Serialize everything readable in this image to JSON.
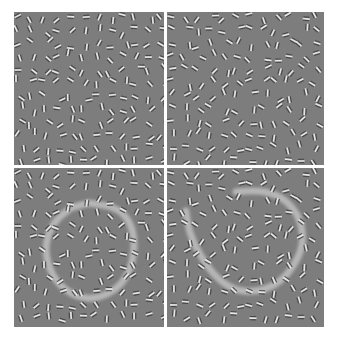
{
  "figure": {
    "background_color": "#ffffff",
    "field_color": "#7d7d7d",
    "element_light": "#e6e6e6",
    "element_dark": "#3a3a3a",
    "contour_color": "#c8c8c8",
    "panels": [
      {
        "id": "top-left",
        "label": "Gabor field (no contour highlight)",
        "seed": 11,
        "highlight": null
      },
      {
        "id": "top-right",
        "label": "Gabor field (no contour highlight)",
        "seed": 23,
        "highlight": null
      },
      {
        "id": "bottom-left",
        "label": "Gabor field with closed contour highlighted",
        "seed": 11,
        "highlight": {
          "closed": true,
          "path": [
            [
              0.5,
              0.22
            ],
            [
              0.7,
              0.25
            ],
            [
              0.8,
              0.38
            ],
            [
              0.8,
              0.58
            ],
            [
              0.72,
              0.74
            ],
            [
              0.55,
              0.83
            ],
            [
              0.38,
              0.8
            ],
            [
              0.25,
              0.68
            ],
            [
              0.2,
              0.5
            ],
            [
              0.26,
              0.34
            ],
            [
              0.38,
              0.25
            ]
          ]
        }
      },
      {
        "id": "bottom-right",
        "label": "Gabor field with open contour highlighted",
        "seed": 23,
        "highlight": {
          "closed": false,
          "path": [
            [
              0.44,
              0.15
            ],
            [
              0.62,
              0.14
            ],
            [
              0.76,
              0.2
            ],
            [
              0.85,
              0.32
            ],
            [
              0.87,
              0.47
            ],
            [
              0.82,
              0.6
            ],
            [
              0.72,
              0.72
            ],
            [
              0.58,
              0.78
            ],
            [
              0.43,
              0.77
            ],
            [
              0.3,
              0.68
            ],
            [
              0.2,
              0.53
            ],
            [
              0.14,
              0.4
            ],
            [
              0.12,
              0.27
            ]
          ]
        }
      }
    ]
  }
}
